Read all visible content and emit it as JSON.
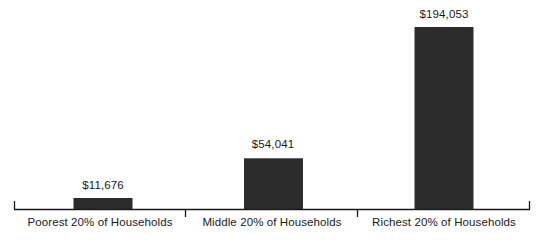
{
  "chart_data": {
    "type": "bar",
    "title": "",
    "subtitle": "",
    "xlabel": "",
    "ylabel": "",
    "categories": [
      "Poorest 20% of Households",
      "Middle 20% of Households",
      "Richest 20% of Households"
    ],
    "values": [
      11676,
      54041,
      194053
    ],
    "data_labels": [
      "$11,676",
      "$54,041",
      "$194,053"
    ],
    "ylim": [
      0,
      194053
    ],
    "grid": false,
    "legend": false,
    "legend_position": "none",
    "bar_color": "#2c2c2c",
    "axis_color": "#1a1a1a",
    "background_color": "#ffffff",
    "annotations": []
  },
  "axis": {
    "tick_marks": [
      "boundary-tick-1",
      "boundary-tick-2"
    ],
    "end_caps": [
      "left-cap",
      "right-cap"
    ]
  }
}
